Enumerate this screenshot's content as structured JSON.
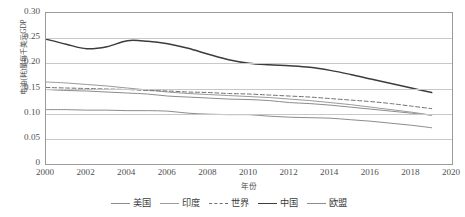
{
  "chart_data": {
    "type": "line",
    "title": "",
    "xlabel": "年份",
    "ylabel": "电油(耗)量每千美元GDP",
    "xlim": [
      2000,
      2020
    ],
    "ylim": [
      0,
      0.3
    ],
    "xticks": [
      "2000",
      "2002",
      "2004",
      "2006",
      "2008",
      "2010",
      "2012",
      "2014",
      "2016",
      "2018",
      "2020"
    ],
    "yticks": [
      "0.30",
      "0.25",
      "0.20",
      "0.15",
      "0.10",
      "0.05",
      "0"
    ],
    "grid": "horizontal",
    "legend_position": "bottom",
    "x": [
      2000,
      2001,
      2002,
      2003,
      2004,
      2005,
      2006,
      2007,
      2008,
      2009,
      2010,
      2011,
      2012,
      2013,
      2014,
      2015,
      2016,
      2017,
      2018,
      2019
    ],
    "series": [
      {
        "name": "美国",
        "style": "solid",
        "color": "#8c8c8c",
        "values": [
          0.148,
          0.146,
          0.145,
          0.143,
          0.141,
          0.139,
          0.135,
          0.133,
          0.131,
          0.129,
          0.128,
          0.126,
          0.122,
          0.12,
          0.117,
          0.113,
          0.109,
          0.105,
          0.101,
          0.097
        ]
      },
      {
        "name": "印度",
        "style": "solid",
        "color": "#9a9a9a",
        "values": [
          0.163,
          0.161,
          0.158,
          0.155,
          0.151,
          0.147,
          0.143,
          0.14,
          0.138,
          0.136,
          0.134,
          0.132,
          0.129,
          0.126,
          0.122,
          0.118,
          0.113,
          0.108,
          0.103,
          0.097
        ]
      },
      {
        "name": "世界",
        "style": "dashed",
        "color": "#6f6f6f",
        "values": [
          0.152,
          0.151,
          0.15,
          0.149,
          0.148,
          0.146,
          0.145,
          0.143,
          0.142,
          0.14,
          0.139,
          0.137,
          0.135,
          0.133,
          0.13,
          0.127,
          0.124,
          0.12,
          0.115,
          0.11
        ]
      },
      {
        "name": "中国",
        "style": "solid",
        "color": "#3c3c3c",
        "values": [
          0.248,
          0.238,
          0.229,
          0.233,
          0.245,
          0.244,
          0.239,
          0.23,
          0.218,
          0.207,
          0.2,
          0.197,
          0.195,
          0.192,
          0.186,
          0.178,
          0.169,
          0.16,
          0.151,
          0.142
        ]
      },
      {
        "name": "欧盟",
        "style": "solid",
        "color": "#8c8c8c",
        "values": [
          0.108,
          0.108,
          0.107,
          0.107,
          0.106,
          0.106,
          0.105,
          0.101,
          0.099,
          0.098,
          0.098,
          0.095,
          0.093,
          0.092,
          0.091,
          0.088,
          0.085,
          0.081,
          0.077,
          0.072
        ]
      }
    ]
  }
}
